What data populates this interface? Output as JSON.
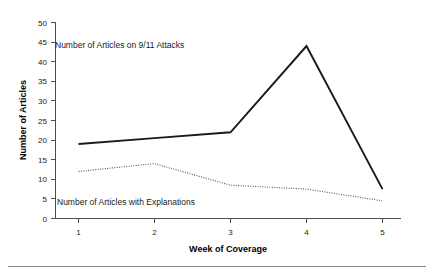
{
  "chart_data": {
    "type": "line",
    "title": "",
    "xlabel": "Week of Coverage",
    "ylabel": "Number of Articles",
    "x": [
      1,
      2,
      3,
      4,
      5
    ],
    "categories": [
      "1",
      "2",
      "3",
      "4",
      "5"
    ],
    "xlim": [
      0.6,
      5.4
    ],
    "ylim": [
      0,
      50
    ],
    "ytick_values": [
      0,
      5,
      10,
      15,
      20,
      25,
      30,
      35,
      40,
      45,
      50
    ],
    "ytick_labels": [
      "0",
      "5",
      "10",
      "15",
      "20",
      "25",
      "30",
      "35",
      "40",
      "45",
      "50"
    ],
    "xtick_labels": [
      "1",
      "2",
      "3",
      "4",
      "5"
    ],
    "grid": false,
    "legend_position": "inline-annotations",
    "series": [
      {
        "name": "Number of Articles on 9/11 Attacks",
        "style": "solid",
        "color": "#1a1a1a",
        "values": [
          19,
          20.5,
          22,
          44,
          7.5
        ]
      },
      {
        "name": "Number of Articles with Explanations",
        "style": "dotted",
        "color": "#555555",
        "values": [
          12,
          14,
          8.5,
          7.5,
          4.5
        ]
      }
    ],
    "annotations": [
      {
        "name": "series-label-attacks",
        "text": "Number of Articles on 9/11 Attacks",
        "x_px": 55,
        "y_px": 48
      },
      {
        "name": "series-label-explanations",
        "text": "Number of Articles with Explanations",
        "x_px": 57,
        "y_px": 205
      }
    ]
  },
  "axis": {
    "y_title": "Number of Articles",
    "x_title": "Week of Coverage",
    "y_ticks": [
      "50",
      "45",
      "40",
      "35",
      "30",
      "25",
      "20",
      "15",
      "10",
      "5",
      "0"
    ],
    "x_ticks": [
      "1",
      "2",
      "3",
      "4",
      "5"
    ]
  },
  "labels": {
    "series_attacks": "Number of Articles on 9/11 Attacks",
    "series_explanations": "Number of Articles with Explanations"
  },
  "colors": {
    "series_attacks": "#1a1a1a",
    "series_explanations": "#555555",
    "axis": "#4d4d4d",
    "background": "#ffffff"
  }
}
